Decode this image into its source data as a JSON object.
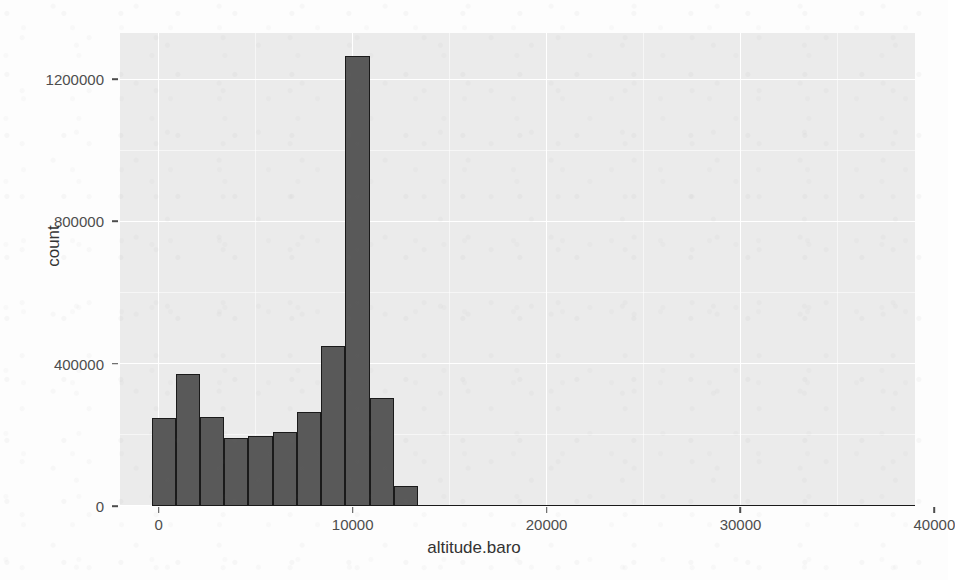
{
  "chart_data": {
    "type": "bar",
    "title": "",
    "subtitle": "",
    "xlabel": "altitude.baro",
    "ylabel": "count",
    "grid": true,
    "legend": null,
    "legend_position": "none",
    "xlim": [
      -2000,
      39000
    ],
    "ylim": [
      0,
      1330000
    ],
    "x_ticks": [
      0,
      10000,
      20000,
      30000,
      40000
    ],
    "x_tick_labels": [
      "0",
      "10000",
      "20000",
      "30000",
      "40000"
    ],
    "y_ticks": [
      0,
      400000,
      800000,
      1200000
    ],
    "y_tick_labels": [
      "0",
      "400000",
      "800000",
      "1200000"
    ],
    "bin_width": 1250,
    "bar_color": "#595959",
    "bar_outline_color": "#1a1a1a",
    "panel_background": "#ebebeb",
    "gridline_color": "#ffffff",
    "bins": [
      {
        "x_start": -375,
        "x_end": 875,
        "x_center": 250,
        "count": 248000
      },
      {
        "x_start": 875,
        "x_end": 2125,
        "x_center": 1500,
        "count": 370000
      },
      {
        "x_start": 2125,
        "x_end": 3375,
        "x_center": 2750,
        "count": 250000
      },
      {
        "x_start": 3375,
        "x_end": 4625,
        "x_center": 4000,
        "count": 192000
      },
      {
        "x_start": 4625,
        "x_end": 5875,
        "x_center": 5250,
        "count": 197000
      },
      {
        "x_start": 5875,
        "x_end": 7125,
        "x_center": 6500,
        "count": 208000
      },
      {
        "x_start": 7125,
        "x_end": 8375,
        "x_center": 7750,
        "count": 265000
      },
      {
        "x_start": 8375,
        "x_end": 9625,
        "x_center": 9000,
        "count": 450000
      },
      {
        "x_start": 9625,
        "x_end": 10875,
        "x_center": 10250,
        "count": 1265000
      },
      {
        "x_start": 10875,
        "x_end": 12125,
        "x_center": 11500,
        "count": 305000
      },
      {
        "x_start": 12125,
        "x_end": 13375,
        "x_center": 12750,
        "count": 55000
      },
      {
        "x_start": 13375,
        "x_end": 39000,
        "x_center": 26000,
        "count": 1500
      }
    ]
  }
}
